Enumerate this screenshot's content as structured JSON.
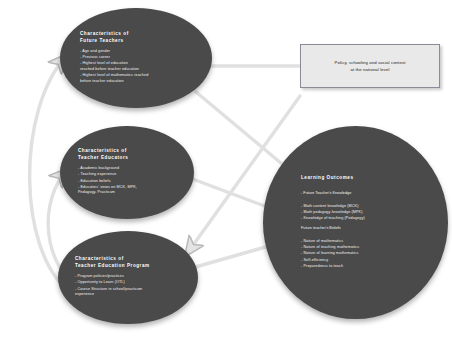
{
  "diagram": {
    "colors": {
      "node_fill": "#4a4a4a",
      "node_text": "#ffffff",
      "box_fill": "#e9e9e9",
      "box_border": "#8a8a99",
      "connector": "#d9d9d9",
      "background": "#ffffff"
    }
  },
  "nodes": {
    "future_teachers": {
      "title": "Characteristics of\nFuture Teachers",
      "bullets": [
        "Age and gender",
        "Previous career",
        "Highest level of education\n  reached before teacher education",
        "Highest level of mathematics reached\n  before teacher education"
      ]
    },
    "teacher_educators": {
      "title": "Characteristics of\nTeacher Educators",
      "bullets": [
        "Academic background",
        "Teaching experience",
        "Education beliefs",
        "Educators' views on MCK, MPK,\n  Pedagogy, Practicum"
      ]
    },
    "teacher_education_program": {
      "title": "Characteristics of\nTeacher Education Program",
      "bullets": [
        "Program policies/practices",
        "Opportunity to Learn (OTL)",
        "Course Structure in school/practicum\n  experience"
      ]
    },
    "learning_outcomes": {
      "title": "Learning Outcomes",
      "knowledge_heading": "- Future Teacher's Knowledge",
      "knowledge_bullets": [
        "Math content knowledge (MCK)",
        "Math pedagogy knowledge (MPK)",
        "Knowledge of teaching (Pedagogy)"
      ],
      "beliefs_heading": "Future teacher's Beliefs",
      "beliefs_bullets": [
        "Nature of mathematics",
        "Nature of teaching mathematics",
        "Nature of learning mathematics",
        "Self-efficiency",
        "Preparedness to teach"
      ]
    },
    "policy_context": {
      "text": "Policy, schooling and social context\nat the national level"
    }
  },
  "connectors": [
    {
      "name": "policy-to-future-teachers",
      "from": "policy_context",
      "to": "future_teachers"
    },
    {
      "name": "future-teachers-to-outcomes",
      "from": "future_teachers",
      "to": "learning_outcomes"
    },
    {
      "name": "teacher-educators-to-outcomes",
      "from": "teacher_educators",
      "to": "learning_outcomes"
    },
    {
      "name": "program-to-outcomes",
      "from": "teacher_education_program",
      "to": "learning_outcomes"
    },
    {
      "name": "program-to-future-teachers",
      "from": "teacher_education_program",
      "to": "future_teachers"
    },
    {
      "name": "program-to-teacher-educators",
      "from": "teacher_education_program",
      "to": "teacher_educators"
    },
    {
      "name": "educators-to-program",
      "from": "teacher_educators",
      "to": "teacher_education_program"
    }
  ]
}
